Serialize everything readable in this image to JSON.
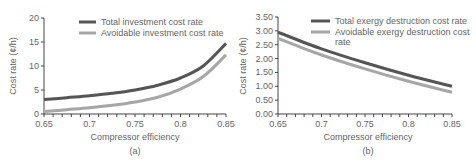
{
  "chart_data": [
    {
      "type": "line",
      "panel": "(a)",
      "title": "",
      "xlabel": "Compressor efficiency",
      "ylabel": "Cost rate (¢/h)",
      "xlim": [
        0.65,
        0.85
      ],
      "ylim": [
        0,
        20
      ],
      "xticks": [
        "0.65",
        "0.7",
        "0.75",
        "0.8",
        "0.85"
      ],
      "yticks": [
        "0",
        "5",
        "10",
        "15",
        "20"
      ],
      "grid": false,
      "legend_position": "top",
      "x": [
        0.65,
        0.675,
        0.7,
        0.725,
        0.75,
        0.775,
        0.8,
        0.825,
        0.85
      ],
      "series": [
        {
          "name": "Total investment cost rate",
          "color": "#555555",
          "values": [
            3.0,
            3.4,
            3.8,
            4.3,
            5.0,
            6.0,
            7.5,
            10.0,
            14.7
          ]
        },
        {
          "name": "Avoidable investment cost rate",
          "color": "#a6a6a6",
          "values": [
            0.5,
            0.9,
            1.3,
            1.8,
            2.5,
            3.5,
            5.2,
            7.8,
            12.3
          ]
        }
      ]
    },
    {
      "type": "line",
      "panel": "(b)",
      "title": "",
      "xlabel": "Compressor efficiency",
      "ylabel": "Cost rate (¢/h)",
      "xlim": [
        0.65,
        0.85
      ],
      "ylim": [
        0,
        3.5
      ],
      "xticks": [
        "0.65",
        "0.7",
        "0.75",
        "0.8",
        "0.85"
      ],
      "yticks": [
        "0.00",
        "0.50",
        "1.00",
        "1.50",
        "2.00",
        "2.50",
        "3.00",
        "3.50"
      ],
      "grid": false,
      "legend_position": "top",
      "x": [
        0.65,
        0.7,
        0.75,
        0.8,
        0.85
      ],
      "series": [
        {
          "name": "Total exergy destruction cost rate",
          "color": "#555555",
          "values": [
            2.95,
            2.35,
            1.85,
            1.4,
            1.0
          ]
        },
        {
          "name": "Avoidable exergy destruction cost rate",
          "color": "#a6a6a6",
          "values": [
            2.73,
            2.13,
            1.63,
            1.18,
            0.78
          ]
        }
      ]
    }
  ],
  "panels": {
    "a": {
      "label": "(a)",
      "xlabel": "Compressor efficiency",
      "ylabel": "Cost rate (¢/h)",
      "legend": [
        "Total investment cost rate",
        "Avoidable investment cost rate"
      ]
    },
    "b": {
      "label": "(b)",
      "xlabel": "Compressor efficiency",
      "ylabel": "Cost rate (¢/h)",
      "legend_line1": "Total exergy destruction cost rate",
      "legend_line2a": "Avoidable exergy destruction cost",
      "legend_line2b": "rate"
    }
  }
}
